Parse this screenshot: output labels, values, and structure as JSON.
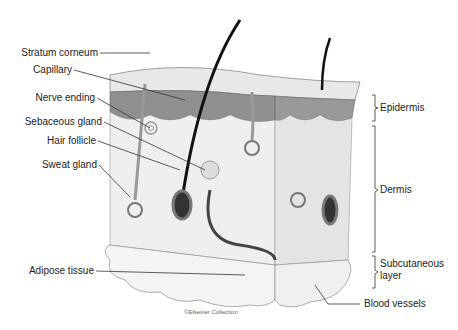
{
  "diagram": {
    "left_labels": [
      {
        "text": "Stratum corneum",
        "y": 53
      },
      {
        "text": "Capillary",
        "y": 70
      },
      {
        "text": "Nerve ending",
        "y": 98
      },
      {
        "text": "Sebaceous gland",
        "y": 122
      },
      {
        "text": "Hair follicle",
        "y": 141
      },
      {
        "text": "Sweat gland",
        "y": 165
      },
      {
        "text": "Adipose tissue",
        "y": 271
      }
    ],
    "right_labels": [
      {
        "text": "Epidermis",
        "y": 108
      },
      {
        "text": "Dermis",
        "y": 190
      },
      {
        "text": "Subcutaneous",
        "y": 264
      },
      {
        "text": "layer",
        "y": 276
      },
      {
        "text": "Blood vessels",
        "y": 304
      }
    ],
    "credit": "©Elsevier Collection"
  }
}
